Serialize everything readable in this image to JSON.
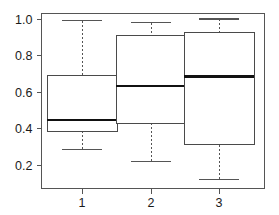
{
  "chart_data": {
    "type": "box",
    "title": "",
    "xlabel": "",
    "ylabel": "",
    "categories": [
      "1",
      "2",
      "3"
    ],
    "ylim": [
      0.08,
      1.03
    ],
    "xlim": [
      0.5,
      3.5
    ],
    "grid": false,
    "legend": null,
    "yticks": [
      0.2,
      0.4,
      0.6,
      0.8,
      1.0
    ],
    "ytick_labels": [
      "0.2",
      "0.4",
      "0.6",
      "0.8",
      "1.0"
    ],
    "xticks": [
      1,
      2,
      3
    ],
    "xtick_labels": [
      "1",
      "2",
      "3"
    ],
    "boxes": [
      {
        "category": "1",
        "lower_whisker": 0.285,
        "q1": 0.385,
        "median": 0.445,
        "q3": 0.69,
        "upper_whisker": 0.99,
        "outliers": []
      },
      {
        "category": "2",
        "lower_whisker": 0.22,
        "q1": 0.43,
        "median": 0.635,
        "q3": 0.91,
        "upper_whisker": 0.98,
        "outliers": []
      },
      {
        "category": "3",
        "lower_whisker": 0.12,
        "q1": 0.31,
        "median": 0.685,
        "q3": 0.925,
        "upper_whisker": 1.0,
        "outliers": []
      }
    ],
    "colors": {
      "box_fill": "#ffffff",
      "box_stroke": "#4a4a4a",
      "median": "#111111",
      "whisker": "#555555",
      "axis": "#555555",
      "background": "#ffffff",
      "text": "#1a1a1a"
    }
  }
}
